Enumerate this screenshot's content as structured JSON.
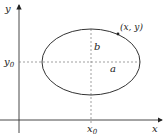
{
  "diagram": {
    "type": "ellipse-with-axes",
    "axes": {
      "x_label": "x",
      "y_label": "y"
    },
    "center": {
      "x_label": "x",
      "x_sub": "0",
      "y_label": "y",
      "y_sub": "0"
    },
    "semi_axes": {
      "horizontal": "a",
      "vertical": "b"
    },
    "point_label": "(x, y)",
    "colors": {
      "stroke": "#333333",
      "dashed": "#777777",
      "background": "#ffffff"
    }
  }
}
